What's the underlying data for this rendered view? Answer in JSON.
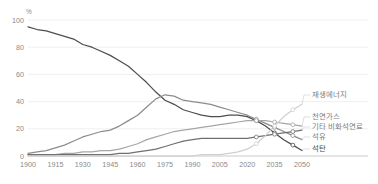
{
  "chart_data": {
    "type": "line",
    "title": "",
    "xlabel": "",
    "ylabel": "",
    "unit_label": "%",
    "xlim": [
      1900,
      2050
    ],
    "ylim": [
      0,
      100
    ],
    "grid": true,
    "legend_position": "right-inline",
    "x_ticks": [
      "1900",
      "1915",
      "1930",
      "1945",
      "1960",
      "1975",
      "1990",
      "2005",
      "2020",
      "2035",
      "2050"
    ],
    "y_ticks": [
      "0",
      "20",
      "40",
      "60",
      "80",
      "100"
    ],
    "x": [
      1900,
      1905,
      1910,
      1915,
      1920,
      1925,
      1930,
      1935,
      1940,
      1945,
      1950,
      1955,
      1960,
      1965,
      1970,
      1975,
      1980,
      1985,
      1990,
      1995,
      2000,
      2005,
      2010,
      2015,
      2020,
      2025,
      2030,
      2035,
      2040,
      2045,
      2050
    ],
    "series": [
      {
        "name": "석탄",
        "color": "#4d4d4d",
        "values": [
          95,
          93,
          92,
          90,
          88,
          86,
          82,
          80,
          77,
          74,
          70,
          66,
          60,
          54,
          47,
          41,
          38,
          34,
          32,
          30,
          29,
          29,
          30,
          30,
          29,
          26,
          22,
          17,
          12,
          8,
          4
        ]
      },
      {
        "name": "석유",
        "color": "#8c8c8c",
        "values": [
          2,
          3,
          4,
          6,
          8,
          11,
          14,
          16,
          18,
          19,
          22,
          26,
          30,
          36,
          42,
          45,
          44,
          41,
          40,
          39,
          38,
          36,
          34,
          32,
          30,
          27,
          24,
          21,
          18,
          15,
          12
        ]
      },
      {
        "name": "천연가스",
        "color": "#a6a6a6",
        "values": [
          1,
          1,
          1,
          1,
          2,
          2,
          3,
          3,
          4,
          4,
          5,
          7,
          9,
          12,
          14,
          16,
          18,
          19,
          20,
          21,
          22,
          23,
          24,
          25,
          26,
          26,
          26,
          25,
          24,
          23,
          22
        ]
      },
      {
        "name": "기타 비화석연료",
        "color": "#707070",
        "values": [
          1,
          1,
          1,
          1,
          1,
          1,
          1,
          1,
          1,
          1,
          2,
          2,
          3,
          4,
          5,
          7,
          9,
          11,
          12,
          13,
          13,
          13,
          13,
          13,
          13,
          14,
          15,
          16,
          17,
          18,
          19
        ]
      },
      {
        "name": "재생에너지",
        "color": "#cfcfcf",
        "values": [
          0,
          0,
          0,
          0,
          0,
          0,
          0,
          0,
          0,
          0,
          0,
          0,
          0,
          0,
          0,
          0,
          0,
          0,
          0,
          1,
          1,
          1,
          2,
          3,
          5,
          9,
          15,
          22,
          29,
          34,
          38
        ]
      }
    ],
    "legend": [
      {
        "label": "재생에너지",
        "color": "#cfcfcf",
        "emphasis": false
      },
      {
        "label": "천연가스",
        "color": "#a6a6a6",
        "emphasis": false
      },
      {
        "label": "기타 비화석연료",
        "color": "#707070",
        "emphasis": false
      },
      {
        "label": "석유",
        "color": "#8c8c8c",
        "emphasis": false
      },
      {
        "label": "석탄",
        "color": "#4d4d4d",
        "emphasis": true
      }
    ]
  }
}
